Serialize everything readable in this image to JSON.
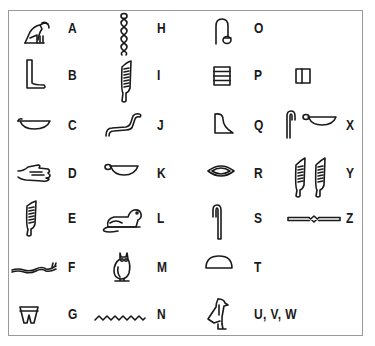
{
  "entries": [
    {
      "letter": "A",
      "glyph": "vulture-icon"
    },
    {
      "letter": "B",
      "glyph": "leg-foot-icon"
    },
    {
      "letter": "C",
      "glyph": "basket-icon"
    },
    {
      "letter": "D",
      "glyph": "hand-icon"
    },
    {
      "letter": "E",
      "glyph": "reed-leaf-icon"
    },
    {
      "letter": "F",
      "glyph": "horned-viper-icon"
    },
    {
      "letter": "G",
      "glyph": "jar-stand-icon"
    },
    {
      "letter": "H",
      "glyph": "twisted-flax-icon"
    },
    {
      "letter": "I",
      "glyph": "reed-leaf-icon"
    },
    {
      "letter": "J",
      "glyph": "cobra-icon"
    },
    {
      "letter": "K",
      "glyph": "basket-with-handle-icon"
    },
    {
      "letter": "L",
      "glyph": "lion-icon"
    },
    {
      "letter": "M",
      "glyph": "owl-icon"
    },
    {
      "letter": "N",
      "glyph": "water-ripple-icon"
    },
    {
      "letter": "O",
      "glyph": "rope-lasso-icon"
    },
    {
      "letter": "P",
      "glyph": "stool-icon"
    },
    {
      "letter": "Q",
      "glyph": "hill-slope-icon"
    },
    {
      "letter": "R",
      "glyph": "mouth-icon"
    },
    {
      "letter": "S",
      "glyph": "folded-cloth-icon"
    },
    {
      "letter": "T",
      "glyph": "bread-loaf-icon"
    },
    {
      "letter": "U, V, W",
      "glyph": "quail-chick-icon"
    },
    {
      "letter": "X",
      "glyph": "staff-and-basket-icon"
    },
    {
      "letter": "Y",
      "glyph": "double-reed-icon"
    },
    {
      "letter": "Z",
      "glyph": "door-bolt-icon"
    }
  ],
  "extra_glyphs": {
    "P_alt": "square-with-bar-icon"
  },
  "colors": {
    "ink": "#1a1a1a",
    "border": "#9a9a9a",
    "background": "#ffffff"
  }
}
